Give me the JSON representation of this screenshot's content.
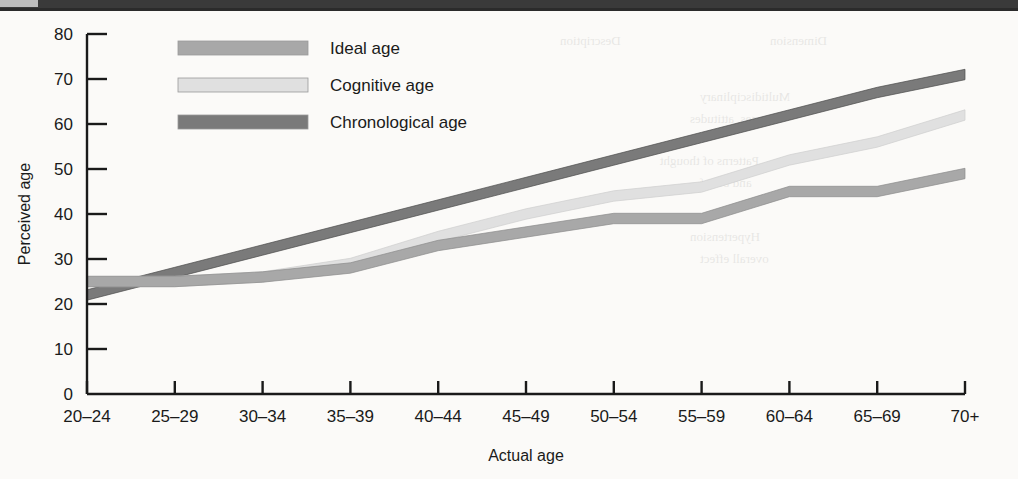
{
  "page": {
    "background_color": "#fbfaf8",
    "top_bar_color": "#3a3a3a",
    "top_tab_color": "#bdbdbd"
  },
  "chart_data": {
    "type": "line",
    "title": "",
    "xlabel": "Actual age",
    "ylabel": "Perceived age",
    "categories": [
      "20–24",
      "25–29",
      "30–34",
      "35–39",
      "40–44",
      "45–49",
      "50–54",
      "55–59",
      "60–64",
      "65–69",
      "70+"
    ],
    "ylim": [
      0,
      80
    ],
    "yticks": [
      0,
      10,
      20,
      30,
      40,
      50,
      60,
      70,
      80
    ],
    "grid": false,
    "legend_position": "top-left-inside",
    "series": [
      {
        "name": "Ideal age",
        "color": "#a8a8a8",
        "edge_color": "#8c8c8c",
        "values": [
          25,
          25,
          26,
          28,
          33,
          36,
          39,
          39,
          45,
          45,
          49
        ]
      },
      {
        "name": "Cognitive age",
        "color": "#e0e0e0",
        "edge_color": "#cfcfcf",
        "values": [
          25,
          25,
          26,
          29,
          35,
          40,
          44,
          46,
          52,
          56,
          62
        ]
      },
      {
        "name": "Chronological age",
        "color": "#7a7a7a",
        "edge_color": "#4d4d4d",
        "values": [
          22,
          27,
          32,
          37,
          42,
          47,
          52,
          57,
          62,
          67,
          71
        ]
      }
    ]
  },
  "legend": {
    "items": [
      {
        "label": "Ideal age",
        "color": "#a8a8a8"
      },
      {
        "label": "Cognitive age",
        "color": "#e0e0e0"
      },
      {
        "label": "Chronological age",
        "color": "#7a7a7a"
      }
    ]
  },
  "ghost_text": {
    "items": [
      {
        "text": "Description",
        "x": 560,
        "y": 22
      },
      {
        "text": "Dimension",
        "x": 770,
        "y": 22
      },
      {
        "text": "Multidisciplinary",
        "x": 700,
        "y": 78
      },
      {
        "text": "changes, attitudes",
        "x": 690,
        "y": 100
      },
      {
        "text": "Patterns of thought",
        "x": 660,
        "y": 142
      },
      {
        "text": "and belief",
        "x": 700,
        "y": 164
      },
      {
        "text": "Hypertension",
        "x": 690,
        "y": 218
      },
      {
        "text": "overall effect",
        "x": 700,
        "y": 240
      }
    ]
  }
}
